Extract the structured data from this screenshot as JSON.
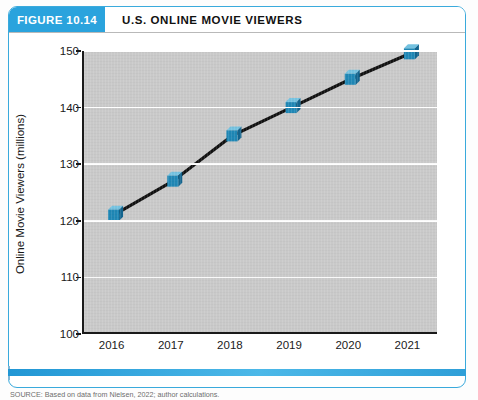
{
  "figure": {
    "badge_label": "FIGURE 10.14",
    "title": "U.S. ONLINE MOVIE VIEWERS",
    "source_note": "SOURCE: Based on data from Nielsen, 2022; author calculations.",
    "accent_color": "#2aa3dd",
    "marker_color": "#1f87b5",
    "plot_background": "#c9c9c9",
    "line_color": "#111111"
  },
  "chart_data": {
    "type": "line",
    "title": "U.S. ONLINE MOVIE VIEWERS",
    "xlabel": "",
    "ylabel": "Online Movie Viewers (millions)",
    "categories": [
      "2016",
      "2017",
      "2018",
      "2019",
      "2020",
      "2021"
    ],
    "values": [
      121,
      127,
      135,
      140,
      145,
      149.5
    ],
    "series": [
      {
        "name": "Online Movie Viewers",
        "values": [
          121,
          127,
          135,
          140,
          145,
          149.5
        ]
      }
    ],
    "ylim": [
      100,
      150
    ],
    "yticks": [
      100,
      110,
      120,
      130,
      140,
      150
    ],
    "ytick_labels": [
      "100",
      "110",
      "120",
      "130",
      "140",
      "150"
    ],
    "xtick_labels": [
      "2016",
      "2017",
      "2018",
      "2019",
      "2020",
      "2021"
    ],
    "grid": "horizontal",
    "legend": "none",
    "marker": "3d-cube"
  }
}
